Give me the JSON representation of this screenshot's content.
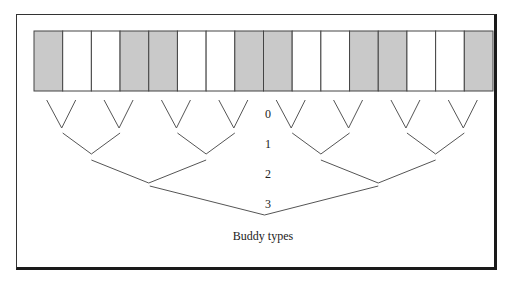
{
  "diagram": {
    "type": "buddy-tree",
    "caption": "Buddy types",
    "colors": {
      "shaded": "#c9c9c9",
      "unshaded": "#ffffff",
      "stroke": "#444444"
    },
    "blocks": {
      "count": 16,
      "pattern": [
        "shaded",
        "unshaded",
        "unshaded",
        "shaded",
        "shaded",
        "unshaded",
        "unshaded",
        "shaded",
        "shaded",
        "unshaded",
        "unshaded",
        "shaded",
        "shaded",
        "unshaded",
        "unshaded",
        "shaded"
      ]
    },
    "levels": [
      {
        "label": "0",
        "merges": 8
      },
      {
        "label": "1",
        "merges": 4
      },
      {
        "label": "2",
        "merges": 2
      },
      {
        "label": "3",
        "merges": 1
      }
    ]
  }
}
